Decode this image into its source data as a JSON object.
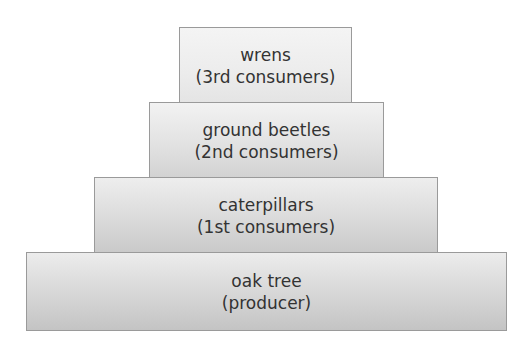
{
  "diagram": {
    "type": "pyramid-of-numbers",
    "colors": {
      "border": "#9a9a9a",
      "text": "#333333",
      "fill_top": "#f0f0f0",
      "fill_bottom": "#c8c8c8"
    },
    "levels": [
      {
        "name": "wrens",
        "role": "(3rd consumers)"
      },
      {
        "name": "ground beetles",
        "role": "(2nd consumers)"
      },
      {
        "name": "caterpillars",
        "role": "(1st consumers)"
      },
      {
        "name": "oak tree",
        "role": "(producer)"
      }
    ]
  }
}
